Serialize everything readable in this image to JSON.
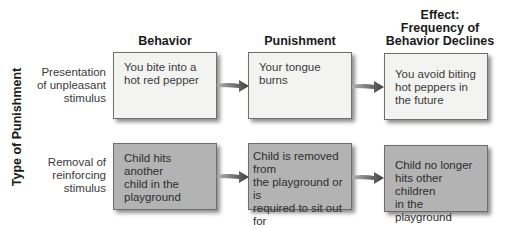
{
  "axis_label": "Type of Punishment",
  "columns": [
    {
      "label": "Behavior"
    },
    {
      "label": "Punishment"
    },
    {
      "label_lines": [
        "Effect:",
        "Frequency of",
        "Behavior Declines"
      ]
    }
  ],
  "rows": [
    {
      "label_lines": [
        "Presentation",
        "of unpleasant",
        "stimulus"
      ],
      "cells": [
        {
          "lines": [
            "You bite into a",
            "hot red pepper"
          ]
        },
        {
          "lines": [
            "Your tongue",
            "burns"
          ]
        },
        {
          "lines": [
            "You avoid biting",
            "hot peppers in",
            "the future"
          ]
        }
      ]
    },
    {
      "label_lines": [
        "Removal of",
        "reinforcing",
        "stimulus"
      ],
      "cells": [
        {
          "lines": [
            "Child hits another",
            "child in the",
            "playground"
          ]
        },
        {
          "lines": [
            "Child is removed from",
            "the playground or is",
            "required to sit out for",
            "a period of time"
          ]
        },
        {
          "lines": [
            "Child no longer",
            "hits other children",
            "in the playground"
          ]
        }
      ]
    }
  ],
  "colors": {
    "row1_box": "#f3f3f2",
    "row2_box": "#b3b3b3",
    "arrow_dark": "#4a4a4a",
    "arrow_light": "#9a9a9a"
  }
}
